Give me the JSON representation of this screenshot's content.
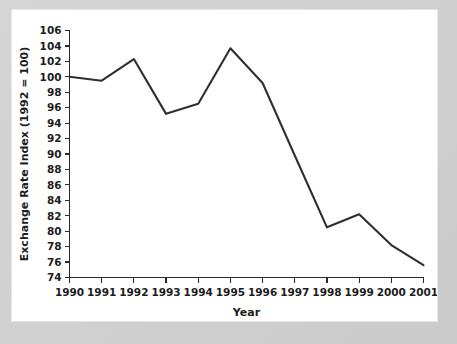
{
  "chart_data": {
    "type": "line",
    "title": "",
    "xlabel": "Year",
    "ylabel": "Exchange Rate Index (1992 = 100)",
    "categories": [
      "1990",
      "1991",
      "1992",
      "1993",
      "1994",
      "1995",
      "1996",
      "1997",
      "1998",
      "1999",
      "2000",
      "2001"
    ],
    "x": [
      1990,
      1991,
      1992,
      1993,
      1994,
      1995,
      1996,
      1997,
      1998,
      1999,
      2000,
      2001
    ],
    "values": [
      100.0,
      99.5,
      102.3,
      95.2,
      96.5,
      103.7,
      99.2,
      89.8,
      80.5,
      82.2,
      78.2,
      75.6
    ],
    "series": [
      {
        "name": "Exchange Rate Index",
        "values": [
          100.0,
          99.5,
          102.3,
          95.2,
          96.5,
          103.7,
          99.2,
          89.8,
          80.5,
          82.2,
          78.2,
          75.6
        ]
      }
    ],
    "ylim": [
      74,
      106
    ],
    "ytick_step": 2,
    "yticks": [
      74,
      76,
      78,
      80,
      82,
      84,
      86,
      88,
      90,
      92,
      94,
      96,
      98,
      100,
      102,
      104,
      106
    ],
    "ytick_labels": [
      "74",
      "76",
      "78",
      "80",
      "82",
      "84",
      "86",
      "88",
      "90",
      "92",
      "94",
      "96",
      "98",
      "100",
      "102",
      "104",
      "106"
    ],
    "xticks": [
      1990,
      1991,
      1992,
      1993,
      1994,
      1995,
      1996,
      1997,
      1998,
      1999,
      2000,
      2001
    ],
    "xtick_labels": [
      "1990",
      "1991",
      "1992",
      "1993",
      "1994",
      "1995",
      "1996",
      "1997",
      "1998",
      "1999",
      "2000",
      "2001"
    ],
    "grid": false,
    "legend": null,
    "legend_position": "none",
    "line_color": "#2f2f33",
    "axis_color": "#2a2a2a",
    "plot_background": "#ffffff",
    "figure_background": "#cfcfd0"
  }
}
